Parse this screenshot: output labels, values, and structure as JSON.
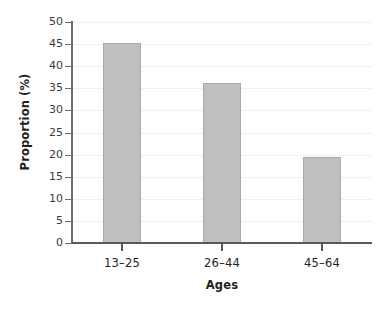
{
  "chart_data": {
    "type": "bar",
    "title": "",
    "subtitle": "",
    "categories": [
      "13–25",
      "26–44",
      "45–64"
    ],
    "values": [
      45.2,
      36.2,
      19.5
    ],
    "xlabel": "Ages",
    "ylabel": "Proportion (%)",
    "ylim": [
      0,
      50
    ],
    "ytick_step": 5,
    "yticks": [
      0,
      5,
      10,
      15,
      20,
      25,
      30,
      35,
      40,
      45,
      50
    ],
    "ytick_labels": [
      "0",
      "5",
      "10",
      "15",
      "20",
      "25",
      "30",
      "35",
      "40",
      "45",
      "50"
    ],
    "xtick_labels": [
      "13–25",
      "26–44",
      "45–64"
    ],
    "grid": "horizontal-faint",
    "legend": "none",
    "annotations": [],
    "series": [
      {
        "name": "Proportion (%)",
        "values": [
          45.2,
          36.2,
          19.5
        ]
      }
    ],
    "colors": {
      "bar_fill": "#bfbfbf",
      "bar_edge": "#a9a9a9",
      "axis": "#58595b",
      "grid": "#f0eff0",
      "text": "#231f20",
      "background": "#ffffff"
    }
  }
}
